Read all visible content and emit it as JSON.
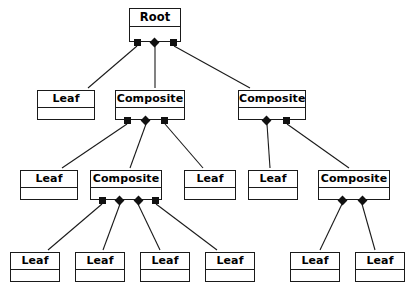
{
  "diagram": {
    "kind": "uml-object-diagram",
    "pattern": "Composite",
    "canvas": {
      "width": 412,
      "height": 300
    },
    "style": {
      "background": "#ffffff",
      "stroke": "#1a1a1a",
      "marker_fill": "#111111",
      "text_color": "#000000",
      "line_width": 1.1,
      "node_border_width": 1.4
    },
    "labels": {
      "root": "Root",
      "leaf": "Leaf",
      "composite": "Composite"
    },
    "nodes": [
      {
        "id": "root",
        "label": "Root",
        "x": 129,
        "y": 8,
        "w": 52,
        "h": 34,
        "title_h": 18,
        "font_size": 11.5
      },
      {
        "id": "l2a",
        "label": "Leaf",
        "x": 37,
        "y": 90,
        "w": 58,
        "h": 30,
        "title_h": 17,
        "font_size": 11
      },
      {
        "id": "c2a",
        "label": "Composite",
        "x": 115,
        "y": 90,
        "w": 70,
        "h": 30,
        "title_h": 17,
        "font_size": 11
      },
      {
        "id": "c2b",
        "label": "Composite",
        "x": 238,
        "y": 90,
        "w": 68,
        "h": 30,
        "title_h": 17,
        "font_size": 11
      },
      {
        "id": "l3a",
        "label": "Leaf",
        "x": 20,
        "y": 170,
        "w": 58,
        "h": 30,
        "title_h": 17,
        "font_size": 11
      },
      {
        "id": "c3a",
        "label": "Composite",
        "x": 90,
        "y": 170,
        "w": 72,
        "h": 30,
        "title_h": 17,
        "font_size": 11
      },
      {
        "id": "l3b",
        "label": "Leaf",
        "x": 184,
        "y": 170,
        "w": 52,
        "h": 30,
        "title_h": 17,
        "font_size": 11
      },
      {
        "id": "l3c",
        "label": "Leaf",
        "x": 248,
        "y": 170,
        "w": 50,
        "h": 30,
        "title_h": 17,
        "font_size": 11
      },
      {
        "id": "c3b",
        "label": "Composite",
        "x": 318,
        "y": 170,
        "w": 72,
        "h": 30,
        "title_h": 17,
        "font_size": 11
      },
      {
        "id": "l4a",
        "label": "Leaf",
        "x": 10,
        "y": 252,
        "w": 50,
        "h": 30,
        "title_h": 17,
        "font_size": 11
      },
      {
        "id": "l4b",
        "label": "Leaf",
        "x": 75,
        "y": 252,
        "w": 50,
        "h": 30,
        "title_h": 17,
        "font_size": 11
      },
      {
        "id": "l4c",
        "label": "Leaf",
        "x": 140,
        "y": 252,
        "w": 50,
        "h": 30,
        "title_h": 17,
        "font_size": 11
      },
      {
        "id": "l4d",
        "label": "Leaf",
        "x": 205,
        "y": 252,
        "w": 50,
        "h": 30,
        "title_h": 17,
        "font_size": 11
      },
      {
        "id": "l4e",
        "label": "Leaf",
        "x": 290,
        "y": 252,
        "w": 50,
        "h": 30,
        "title_h": 17,
        "font_size": 11
      },
      {
        "id": "l4f",
        "label": "Leaf",
        "x": 355,
        "y": 252,
        "w": 50,
        "h": 30,
        "title_h": 17,
        "font_size": 11
      }
    ],
    "markers": [
      {
        "id": "m-root-1",
        "parent": "root",
        "shape": "square",
        "x": 134,
        "y": 39
      },
      {
        "id": "m-root-2",
        "parent": "root",
        "shape": "diamond",
        "x": 151,
        "y": 39
      },
      {
        "id": "m-root-3",
        "parent": "root",
        "shape": "square",
        "x": 170,
        "y": 39
      },
      {
        "id": "m-c2a-1",
        "parent": "c2a",
        "shape": "square",
        "x": 124,
        "y": 117
      },
      {
        "id": "m-c2a-2",
        "parent": "c2a",
        "shape": "diamond",
        "x": 142,
        "y": 117
      },
      {
        "id": "m-c2a-3",
        "parent": "c2a",
        "shape": "square",
        "x": 161,
        "y": 117
      },
      {
        "id": "m-c2b-1",
        "parent": "c2b",
        "shape": "diamond",
        "x": 263,
        "y": 117
      },
      {
        "id": "m-c2b-2",
        "parent": "c2b",
        "shape": "square",
        "x": 283,
        "y": 117
      },
      {
        "id": "m-c3a-1",
        "parent": "c3a",
        "shape": "square",
        "x": 99,
        "y": 197
      },
      {
        "id": "m-c3a-2",
        "parent": "c3a",
        "shape": "diamond",
        "x": 116,
        "y": 197
      },
      {
        "id": "m-c3a-3",
        "parent": "c3a",
        "shape": "diamond",
        "x": 135,
        "y": 197
      },
      {
        "id": "m-c3a-4",
        "parent": "c3a",
        "shape": "square",
        "x": 152,
        "y": 197
      },
      {
        "id": "m-c3b-1",
        "parent": "c3b",
        "shape": "diamond",
        "x": 339,
        "y": 197
      },
      {
        "id": "m-c3b-2",
        "parent": "c3b",
        "shape": "diamond",
        "x": 359,
        "y": 197
      }
    ],
    "edges": [
      {
        "id": "e-root-l2a",
        "from": "root",
        "to": "l2a",
        "x1": 137,
        "y1": 46,
        "x2": 88,
        "y2": 88
      },
      {
        "id": "e-root-c2a",
        "from": "root",
        "to": "c2a",
        "x1": 155,
        "y1": 46,
        "x2": 155,
        "y2": 88
      },
      {
        "id": "e-root-c2b",
        "from": "root",
        "to": "c2b",
        "x1": 174,
        "y1": 46,
        "x2": 250,
        "y2": 88
      },
      {
        "id": "e-c2a-l3a",
        "from": "c2a",
        "to": "l3a",
        "x1": 127,
        "y1": 124,
        "x2": 62,
        "y2": 168
      },
      {
        "id": "e-c2a-c3a",
        "from": "c2a",
        "to": "c3a",
        "x1": 146,
        "y1": 124,
        "x2": 130,
        "y2": 168
      },
      {
        "id": "e-c2a-l3b",
        "from": "c2a",
        "to": "l3b",
        "x1": 165,
        "y1": 124,
        "x2": 203,
        "y2": 168
      },
      {
        "id": "e-c2b-l3c",
        "from": "c2b",
        "to": "l3c",
        "x1": 267,
        "y1": 124,
        "x2": 270,
        "y2": 168
      },
      {
        "id": "e-c2b-c3b",
        "from": "c2b",
        "to": "c3b",
        "x1": 287,
        "y1": 124,
        "x2": 349,
        "y2": 168
      },
      {
        "id": "e-c3a-l4a",
        "from": "c3a",
        "to": "l4a",
        "x1": 102,
        "y1": 204,
        "x2": 48,
        "y2": 250
      },
      {
        "id": "e-c3a-l4b",
        "from": "c3a",
        "to": "l4b",
        "x1": 120,
        "y1": 204,
        "x2": 103,
        "y2": 250
      },
      {
        "id": "e-c3a-l4c",
        "from": "c3a",
        "to": "l4c",
        "x1": 138,
        "y1": 204,
        "x2": 160,
        "y2": 250
      },
      {
        "id": "e-c3a-l4d",
        "from": "c3a",
        "to": "l4d",
        "x1": 156,
        "y1": 204,
        "x2": 217,
        "y2": 250
      },
      {
        "id": "e-c3b-l4e",
        "from": "c3b",
        "to": "l4e",
        "x1": 342,
        "y1": 204,
        "x2": 320,
        "y2": 250
      },
      {
        "id": "e-c3b-l4f",
        "from": "c3b",
        "to": "l4f",
        "x1": 362,
        "y1": 204,
        "x2": 375,
        "y2": 250
      }
    ]
  }
}
